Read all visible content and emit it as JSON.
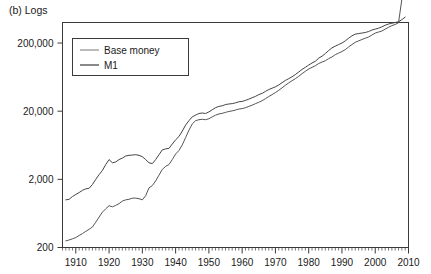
{
  "figure": {
    "panel_label": "(b) Logs"
  },
  "chart_data": {
    "type": "line",
    "title": "(b) Logs",
    "xlabel": "",
    "ylabel": "",
    "yscale": "log",
    "ylim": [
      200,
      400000
    ],
    "xlim": [
      1906,
      2010
    ],
    "grid": false,
    "legend_position": "top-left",
    "y_ticks": [
      200,
      2000,
      20000,
      200000
    ],
    "y_tick_labels": [
      "200",
      "2,000",
      "20,000",
      "200,000"
    ],
    "x_ticks": [
      1910,
      1920,
      1930,
      1940,
      1950,
      1960,
      1970,
      1980,
      1990,
      2000,
      2010
    ],
    "x_tick_labels": [
      "1910",
      "1920",
      "1930",
      "1940",
      "1950",
      "1960",
      "1970",
      "1980",
      "1990",
      "2000",
      "2010"
    ],
    "x_minor_tick_interval": 1,
    "series": [
      {
        "name": "Base money",
        "color": "#555555",
        "x": [
          1907,
          1908,
          1909,
          1910,
          1911,
          1912,
          1913,
          1914,
          1915,
          1916,
          1917,
          1918,
          1919,
          1920,
          1921,
          1922,
          1923,
          1924,
          1925,
          1926,
          1927,
          1928,
          1929,
          1930,
          1931,
          1932,
          1933,
          1934,
          1935,
          1936,
          1937,
          1938,
          1939,
          1940,
          1941,
          1942,
          1943,
          1944,
          1945,
          1946,
          1947,
          1948,
          1949,
          1950,
          1951,
          1952,
          1953,
          1954,
          1955,
          1956,
          1957,
          1958,
          1959,
          1960,
          1961,
          1962,
          1963,
          1964,
          1965,
          1966,
          1967,
          1968,
          1969,
          1970,
          1971,
          1972,
          1973,
          1974,
          1975,
          1976,
          1977,
          1978,
          1979,
          1980,
          1981,
          1982,
          1983,
          1984,
          1985,
          1986,
          1987,
          1988,
          1989,
          1990,
          1991,
          1992,
          1993,
          1994,
          1995,
          1996,
          1997,
          1998,
          1999,
          2000,
          2001,
          2002,
          2003,
          2004,
          2005,
          2006,
          2007,
          2008,
          2009
        ],
        "y": [
          250,
          258,
          268,
          280,
          300,
          320,
          345,
          370,
          400,
          470,
          560,
          660,
          740,
          820,
          790,
          830,
          880,
          960,
          1000,
          1020,
          1060,
          1060,
          1040,
          1000,
          1150,
          1500,
          1620,
          1900,
          2300,
          2800,
          3100,
          3300,
          3900,
          4700,
          5300,
          6400,
          8200,
          10500,
          13000,
          14500,
          15000,
          15200,
          15000,
          15500,
          16500,
          17500,
          18200,
          18600,
          19200,
          19800,
          20200,
          20800,
          21500,
          21800,
          22500,
          23500,
          24500,
          25800,
          27000,
          28500,
          30500,
          32800,
          35000,
          37500,
          40500,
          44000,
          48000,
          52000,
          56000,
          60000,
          65000,
          71000,
          77000,
          83000,
          88000,
          93000,
          100000,
          105000,
          110000,
          118000,
          125000,
          135000,
          142000,
          150000,
          160000,
          175000,
          190000,
          205000,
          215000,
          225000,
          235000,
          245000,
          262000,
          280000,
          290000,
          300000,
          320000,
          340000,
          360000,
          375000,
          395000,
          880000,
          950000
        ]
      },
      {
        "name": "M1",
        "color": "#444444",
        "x": [
          1907,
          1908,
          1909,
          1910,
          1911,
          1912,
          1913,
          1914,
          1915,
          1916,
          1917,
          1918,
          1919,
          1920,
          1921,
          1922,
          1923,
          1924,
          1925,
          1926,
          1927,
          1928,
          1929,
          1930,
          1931,
          1932,
          1933,
          1934,
          1935,
          1936,
          1937,
          1938,
          1939,
          1940,
          1941,
          1942,
          1943,
          1944,
          1945,
          1946,
          1947,
          1948,
          1949,
          1950,
          1951,
          1952,
          1953,
          1954,
          1955,
          1956,
          1957,
          1958,
          1959,
          1960,
          1961,
          1962,
          1963,
          1964,
          1965,
          1966,
          1967,
          1968,
          1969,
          1970,
          1971,
          1972,
          1973,
          1974,
          1975,
          1976,
          1977,
          1978,
          1979,
          1980,
          1981,
          1982,
          1983,
          1984,
          1985,
          1986,
          1987,
          1988,
          1989,
          1990,
          1991,
          1992,
          1993,
          1994,
          1995,
          1996,
          1997,
          1998,
          1999,
          2000,
          2001,
          2002,
          2003,
          2004,
          2005,
          2006,
          2007,
          2008,
          2009
        ],
        "y": [
          1000,
          1020,
          1120,
          1200,
          1280,
          1380,
          1450,
          1480,
          1680,
          2000,
          2350,
          2700,
          3300,
          3900,
          3500,
          3600,
          3900,
          4100,
          4400,
          4500,
          4550,
          4600,
          4500,
          4300,
          3900,
          3500,
          3400,
          3900,
          4600,
          5400,
          5600,
          5700,
          6600,
          7600,
          8500,
          10200,
          12500,
          14500,
          16500,
          17500,
          18500,
          18800,
          18500,
          19500,
          21000,
          22500,
          23500,
          24000,
          25000,
          25500,
          25800,
          26500,
          27500,
          27800,
          28800,
          30000,
          31500,
          33000,
          35000,
          36500,
          39000,
          41500,
          43500,
          45500,
          48500,
          52500,
          56500,
          60000,
          64000,
          69000,
          75000,
          82000,
          88000,
          95000,
          102000,
          108000,
          120000,
          128000,
          140000,
          155000,
          170000,
          180000,
          190000,
          200000,
          215000,
          235000,
          255000,
          270000,
          275000,
          280000,
          285000,
          295000,
          310000,
          320000,
          330000,
          345000,
          365000,
          380000,
          390000,
          400000,
          410000,
          440000,
          480000
        ]
      }
    ]
  },
  "legend": {
    "items": [
      {
        "label": "Base money"
      },
      {
        "label": "M1"
      }
    ]
  }
}
